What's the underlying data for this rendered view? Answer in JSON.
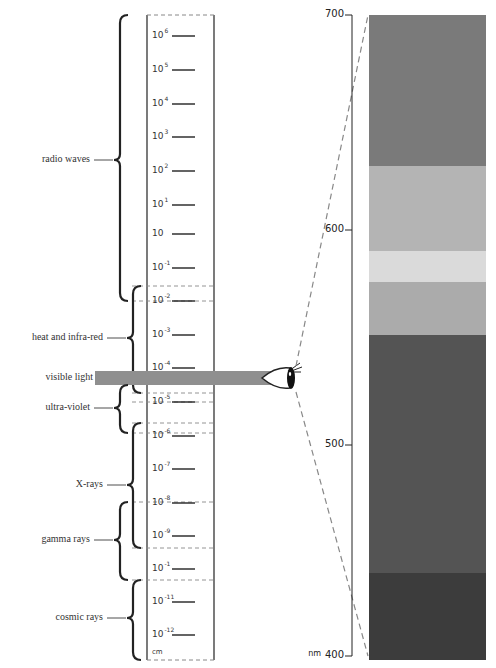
{
  "chart_data": {
    "type": "diagram",
    "title": "",
    "wavelength_scale": {
      "unit": "cm",
      "ticks": [
        {
          "base": "10",
          "exp": "6",
          "y": 36
        },
        {
          "base": "10",
          "exp": "5",
          "y": 70
        },
        {
          "base": "10",
          "exp": "4",
          "y": 104
        },
        {
          "base": "10",
          "exp": "3",
          "y": 137
        },
        {
          "base": "10",
          "exp": "2",
          "y": 171
        },
        {
          "base": "10",
          "exp": "1",
          "y": 205
        },
        {
          "base": "10",
          "exp": "",
          "y": 234
        },
        {
          "base": "10",
          "exp": "-1",
          "y": 268
        },
        {
          "base": "10",
          "exp": "-2",
          "y": 301
        },
        {
          "base": "10",
          "exp": "-3",
          "y": 335
        },
        {
          "base": "10",
          "exp": "-4",
          "y": 368
        },
        {
          "base": "10",
          "exp": "-5",
          "y": 402
        },
        {
          "base": "10",
          "exp": "-6",
          "y": 436
        },
        {
          "base": "10",
          "exp": "-7",
          "y": 469
        },
        {
          "base": "10",
          "exp": "-8",
          "y": 503
        },
        {
          "base": "10",
          "exp": "-9",
          "y": 536
        },
        {
          "base": "10",
          "exp": "-1",
          "y": 569
        },
        {
          "base": "10",
          "exp": "-11",
          "y": 602
        },
        {
          "base": "10",
          "exp": "-12",
          "y": 635
        }
      ]
    },
    "regions": [
      {
        "label": "radio waves",
        "top": 15,
        "bottom": 301,
        "label_y": 160,
        "bracket_x": 120
      },
      {
        "label": "heat and infra-red",
        "top": 286,
        "bottom": 393,
        "label_y": 338,
        "bracket_x": 133
      },
      {
        "label": "visible light",
        "top": 371,
        "bottom": 385,
        "label_y": 378
      },
      {
        "label": "ultra-violet",
        "top": 385,
        "bottom": 433,
        "label_y": 408,
        "bracket_x": 120
      },
      {
        "label": "X-rays",
        "top": 423,
        "bottom": 548,
        "label_y": 485,
        "bracket_x": 133
      },
      {
        "label": "gamma rays",
        "top": 502,
        "bottom": 580,
        "label_y": 540,
        "bracket_x": 120
      },
      {
        "label": "cosmic rays",
        "top": 580,
        "bottom": 660,
        "label_y": 618,
        "bracket_x": 133
      }
    ],
    "visible_spectrum": {
      "unit": "nm",
      "axis_ticks": [
        {
          "label": "700",
          "y": 15
        },
        {
          "label": "600",
          "y": 230
        },
        {
          "label": "500",
          "y": 445
        },
        {
          "label": "400",
          "y": 656
        }
      ],
      "bands": [
        {
          "from_nm": 700,
          "to_nm": 630,
          "top": 15,
          "bottom": 166,
          "color": "#7a7a7a"
        },
        {
          "from_nm": 630,
          "to_nm": 590,
          "top": 166,
          "bottom": 251,
          "color": "#b4b4b4"
        },
        {
          "from_nm": 590,
          "to_nm": 575,
          "top": 251,
          "bottom": 282,
          "color": "#dadada"
        },
        {
          "from_nm": 575,
          "to_nm": 550,
          "top": 282,
          "bottom": 335,
          "color": "#ababab"
        },
        {
          "from_nm": 550,
          "to_nm": 440,
          "top": 335,
          "bottom": 573,
          "color": "#545454"
        },
        {
          "from_nm": 440,
          "to_nm": 400,
          "top": 573,
          "bottom": 660,
          "color": "#3c3c3c"
        }
      ]
    }
  },
  "labels": {
    "unit_cm": "cm",
    "unit_nm": "nm"
  },
  "colors": {
    "ink": "#222222",
    "dash": "#888888",
    "visible_bar": "#8f8f8f"
  }
}
